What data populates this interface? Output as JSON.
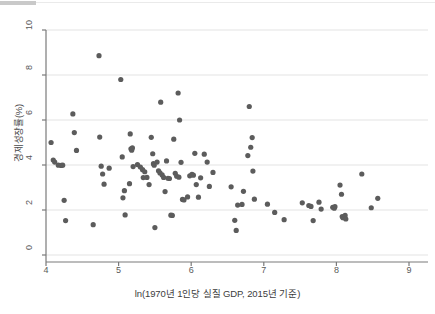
{
  "chart_data": {
    "type": "scatter",
    "title": "",
    "xlabel": "ln(1970년 1인당 실질 GDP, 2015년 기준)",
    "ylabel": "경제성장률(%)",
    "xlim": [
      4,
      9
    ],
    "ylim": [
      0,
      10
    ],
    "xticks": [
      4,
      5,
      6,
      7,
      8,
      9
    ],
    "yticks": [
      0,
      2,
      4,
      6,
      8,
      10
    ],
    "xtick_labels": [
      "4",
      "5",
      "6",
      "7",
      "8",
      "9"
    ],
    "ytick_labels": [
      "0",
      "2",
      "4",
      "6",
      "8",
      "10"
    ],
    "grid": true,
    "grid_axis": "y",
    "legend": "none",
    "marker": {
      "shape": "circle",
      "color": "#5c5c5c",
      "radius_px": 2.6
    },
    "series": [
      {
        "name": "국가별 관측치",
        "points": [
          [
            4.07,
            5.0
          ],
          [
            4.1,
            4.22
          ],
          [
            4.12,
            4.13
          ],
          [
            4.17,
            3.99
          ],
          [
            4.21,
            3.98
          ],
          [
            4.23,
            3.99
          ],
          [
            4.25,
            2.43
          ],
          [
            4.27,
            1.53
          ],
          [
            4.37,
            6.27
          ],
          [
            4.39,
            5.44
          ],
          [
            4.42,
            4.65
          ],
          [
            4.65,
            1.35
          ],
          [
            4.73,
            8.86
          ],
          [
            4.74,
            5.24
          ],
          [
            4.76,
            3.95
          ],
          [
            4.78,
            3.6
          ],
          [
            4.8,
            3.15
          ],
          [
            4.87,
            3.86
          ],
          [
            5.03,
            7.8
          ],
          [
            5.05,
            4.36
          ],
          [
            5.06,
            2.54
          ],
          [
            5.08,
            2.86
          ],
          [
            5.09,
            1.78
          ],
          [
            5.15,
            3.17
          ],
          [
            5.16,
            5.38
          ],
          [
            5.17,
            4.72
          ],
          [
            5.18,
            4.66
          ],
          [
            5.19,
            4.76
          ],
          [
            5.2,
            3.93
          ],
          [
            5.26,
            4.02
          ],
          [
            5.3,
            3.91
          ],
          [
            5.33,
            3.79
          ],
          [
            5.34,
            3.44
          ],
          [
            5.36,
            3.7
          ],
          [
            5.39,
            3.45
          ],
          [
            5.42,
            3.13
          ],
          [
            5.45,
            5.23
          ],
          [
            5.47,
            4.5
          ],
          [
            5.48,
            4.06
          ],
          [
            5.49,
            3.99
          ],
          [
            5.5,
            1.22
          ],
          [
            5.53,
            4.13
          ],
          [
            5.55,
            3.74
          ],
          [
            5.57,
            3.65
          ],
          [
            5.58,
            6.79
          ],
          [
            5.6,
            3.56
          ],
          [
            5.62,
            3.45
          ],
          [
            5.64,
            2.82
          ],
          [
            5.66,
            4.18
          ],
          [
            5.68,
            3.41
          ],
          [
            5.7,
            3.4
          ],
          [
            5.72,
            1.77
          ],
          [
            5.74,
            1.76
          ],
          [
            5.76,
            5.15
          ],
          [
            5.78,
            3.63
          ],
          [
            5.8,
            3.5
          ],
          [
            5.82,
            7.2
          ],
          [
            5.83,
            3.46
          ],
          [
            5.84,
            6.0
          ],
          [
            5.86,
            4.12
          ],
          [
            5.88,
            2.47
          ],
          [
            5.9,
            2.45
          ],
          [
            5.95,
            2.58
          ],
          [
            5.98,
            3.52
          ],
          [
            6.01,
            3.58
          ],
          [
            6.03,
            3.55
          ],
          [
            6.05,
            4.52
          ],
          [
            6.07,
            3.13
          ],
          [
            6.1,
            2.57
          ],
          [
            6.13,
            3.43
          ],
          [
            6.18,
            4.48
          ],
          [
            6.22,
            4.13
          ],
          [
            6.25,
            3.05
          ],
          [
            6.3,
            3.67
          ],
          [
            6.55,
            3.03
          ],
          [
            6.6,
            1.54
          ],
          [
            6.62,
            1.09
          ],
          [
            6.64,
            2.22
          ],
          [
            6.7,
            2.25
          ],
          [
            6.72,
            2.83
          ],
          [
            6.78,
            4.42
          ],
          [
            6.8,
            6.6
          ],
          [
            6.82,
            4.79
          ],
          [
            6.84,
            5.22
          ],
          [
            6.85,
            3.73
          ],
          [
            6.87,
            2.48
          ],
          [
            7.05,
            2.26
          ],
          [
            7.15,
            1.89
          ],
          [
            7.28,
            1.57
          ],
          [
            7.53,
            2.32
          ],
          [
            7.62,
            2.2
          ],
          [
            7.65,
            2.16
          ],
          [
            7.68,
            1.53
          ],
          [
            7.76,
            2.35
          ],
          [
            7.79,
            2.04
          ],
          [
            7.95,
            2.12
          ],
          [
            7.97,
            2.08
          ],
          [
            7.98,
            2.15
          ],
          [
            8.05,
            3.11
          ],
          [
            8.07,
            2.7
          ],
          [
            8.08,
            1.71
          ],
          [
            8.09,
            1.66
          ],
          [
            8.12,
            1.76
          ],
          [
            8.13,
            1.6
          ],
          [
            8.35,
            3.6
          ],
          [
            8.48,
            2.1
          ],
          [
            8.57,
            2.52
          ]
        ]
      }
    ]
  },
  "figure": {
    "background": "#ffffff",
    "axis_color": "#7a7a7a",
    "grid_color": "#e3e3e3",
    "tick_text_color": "#5a5a5a"
  }
}
